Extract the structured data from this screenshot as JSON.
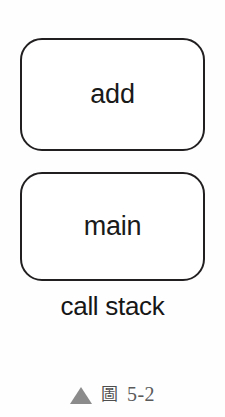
{
  "diagram": {
    "title": "call stack",
    "type": "call-stack-diagram",
    "frames": [
      {
        "id": "add",
        "label": "add"
      },
      {
        "id": "main",
        "label": "main"
      }
    ],
    "stack_label": "call stack"
  },
  "figure_caption": {
    "marker_icon": "triangle-up-icon",
    "prefix_cjk": "圖",
    "number": "5-2"
  },
  "colors": {
    "background": "#fefefe",
    "box_fill": "#ffffff",
    "box_stroke": "#221f20",
    "text": "#1a1a1a",
    "caption_marker": "#8b8b8b",
    "caption_text": "#5a5a5a"
  }
}
